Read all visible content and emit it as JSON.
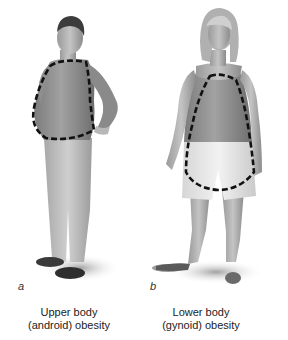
{
  "panels": [
    {
      "letter": "a",
      "caption_line1": "Upper body",
      "caption_line2": "(android) obesity",
      "figure": "male-figure-apple-shape",
      "outline_region": "upper torso / abdomen"
    },
    {
      "letter": "b",
      "caption_line1": "Lower body",
      "caption_line2": "(gynoid) obesity",
      "figure": "female-figure-pear-shape",
      "outline_region": "hips / thighs"
    }
  ],
  "colors": {
    "background": "#ffffff",
    "outline_dash": "#111111",
    "figure_gray": "#8a8a8a"
  }
}
